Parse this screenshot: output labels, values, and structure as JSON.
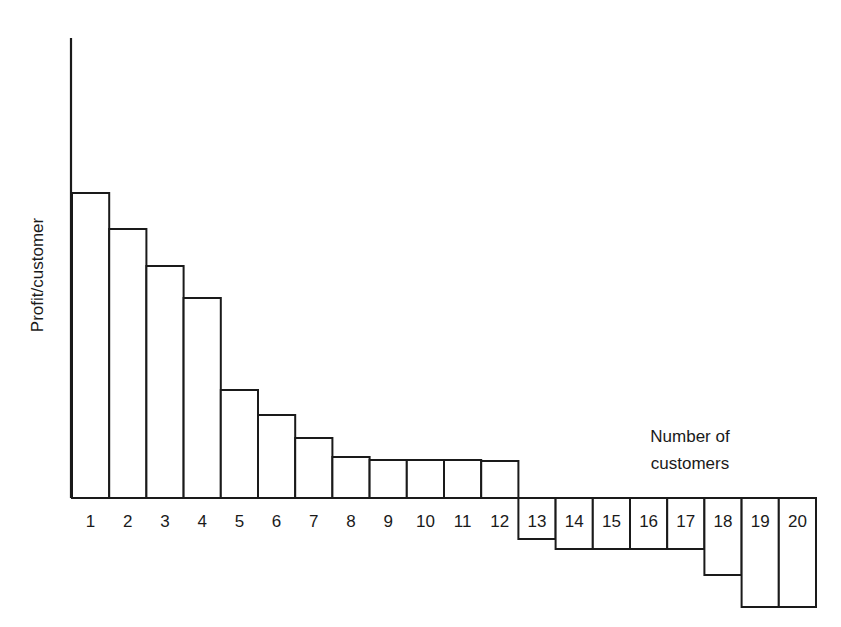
{
  "chart_data": {
    "type": "bar",
    "title": "",
    "xlabel": "Number of customers",
    "ylabel": "Profit/customer",
    "categories": [
      "1",
      "2",
      "3",
      "4",
      "5",
      "6",
      "7",
      "8",
      "9",
      "10",
      "11",
      "12",
      "13",
      "14",
      "15",
      "16",
      "17",
      "18",
      "19",
      "20"
    ],
    "values": [
      305,
      269,
      232,
      200,
      108,
      83,
      60,
      41,
      38,
      38,
      38,
      37,
      -41,
      -51,
      -51,
      -51,
      -51,
      -77,
      -109,
      -109
    ],
    "units": "relative (pixel-scaled, no y tick labels shown)",
    "grid": false,
    "legend": null,
    "ylim": [
      -109,
      460
    ]
  },
  "labels": {
    "xlabel_line1": "Number of",
    "xlabel_line2": "customers",
    "ylabel": "Profit/customer"
  }
}
